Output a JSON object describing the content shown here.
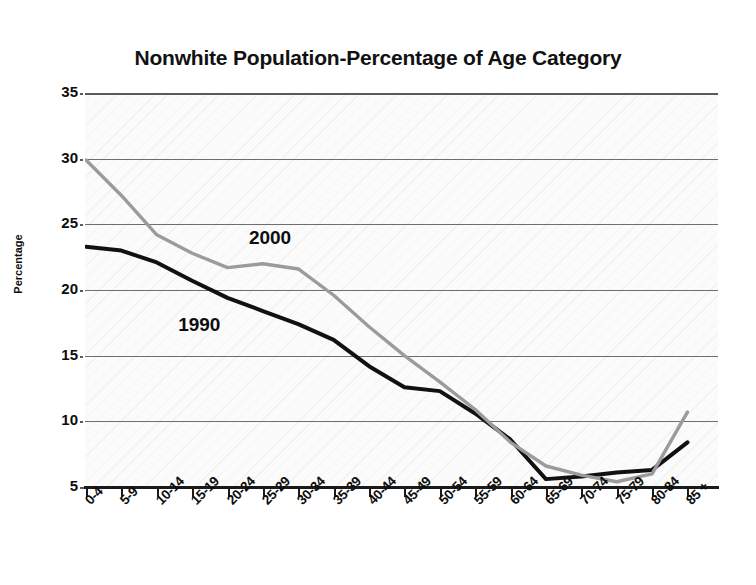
{
  "chart_data": {
    "type": "line",
    "title": "Nonwhite Population-Percentage of Age Category",
    "xlabel": "",
    "ylabel": "Percentage",
    "categories": [
      "0-4",
      "5-9",
      "10-14",
      "15-19",
      "20-24",
      "25-29",
      "30-34",
      "35-39",
      "40-44",
      "45-49",
      "50-54",
      "55-59",
      "60-64",
      "65-69",
      "70-74",
      "75-79",
      "80-84",
      "85 +"
    ],
    "ylim": [
      5,
      35
    ],
    "yticks": [
      5,
      10,
      15,
      20,
      25,
      30,
      35
    ],
    "grid": true,
    "legend_position": "inline-annotations",
    "series": [
      {
        "name": "1990",
        "color": "#111111",
        "values": [
          23.3,
          23.0,
          22.1,
          20.7,
          19.4,
          18.4,
          17.4,
          16.2,
          14.2,
          12.6,
          12.3,
          10.6,
          8.6,
          5.6,
          5.8,
          6.1,
          6.3,
          8.4
        ]
      },
      {
        "name": "2000",
        "color": "#9b9b9b",
        "values": [
          29.9,
          27.2,
          24.2,
          22.8,
          21.7,
          22.0,
          21.6,
          19.6,
          17.2,
          15.0,
          13.0,
          10.9,
          8.4,
          6.6,
          5.9,
          5.4,
          6.0,
          10.7
        ]
      }
    ],
    "annotations": [
      {
        "text": "2000",
        "x_category": "25-29",
        "value": 23.8
      },
      {
        "text": "1990",
        "x_category": "15-19",
        "value": 17.2
      }
    ]
  }
}
